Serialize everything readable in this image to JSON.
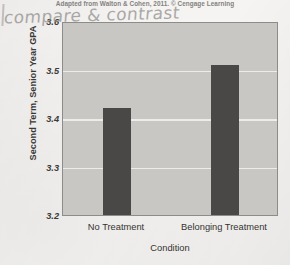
{
  "caption": {
    "source_note": "Adapted from Walton & Cohen, 2011. © Cengage Learning"
  },
  "annotation": {
    "handwritten_note": "compare & contrast"
  },
  "colors": {
    "bar": "#4a4846",
    "plot_background": "#c9c7c4",
    "gridline": "#efeeec",
    "page_background": "#f5f4f2",
    "axis_text": "#35332f",
    "handwriting": "#8e8c8a"
  },
  "chart_data": {
    "type": "bar",
    "title": "",
    "categories": [
      "No Treatment",
      "Belonging Treatment"
    ],
    "values": [
      3.42,
      3.51
    ],
    "xlabel": "Condition",
    "ylabel": "Second Term, Senior Year GPA",
    "ylim": [
      3.2,
      3.6
    ],
    "yticks": [
      3.6,
      3.5,
      3.4,
      3.3,
      3.2
    ],
    "ytick_labels": [
      "3.6",
      "3.5",
      "3.4",
      "3.3",
      "3.2"
    ],
    "grid": true,
    "legend": false,
    "legend_position": "none"
  }
}
